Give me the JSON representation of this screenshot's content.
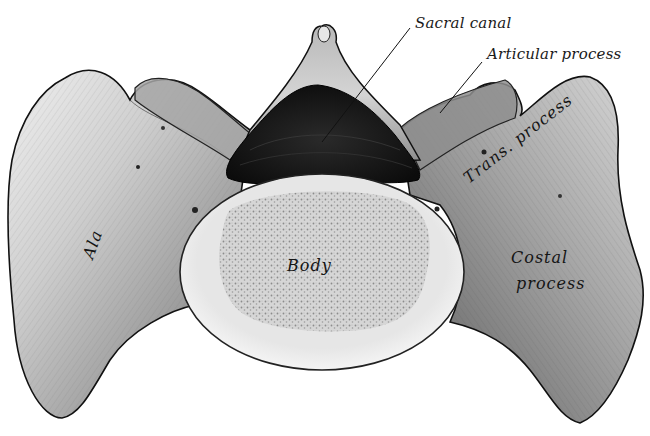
{
  "figure": {
    "colors": {
      "background": "#ffffff",
      "bone_light": "#e8e8e8",
      "bone_mid": "#9a9a9a",
      "bone_dark": "#3a3a3a",
      "canal": "#141414",
      "body_rim": "#ececec",
      "body_spongy": "#cfcfcf",
      "ink": "#1a1a1a"
    }
  },
  "labels": {
    "sacral_canal": "Sacral canal",
    "articular_process": "Articular process",
    "trans_process": "Trans. process",
    "costal_process_line1": "Costal",
    "costal_process_line2": "process",
    "ala": "Ala",
    "body": "Body"
  }
}
